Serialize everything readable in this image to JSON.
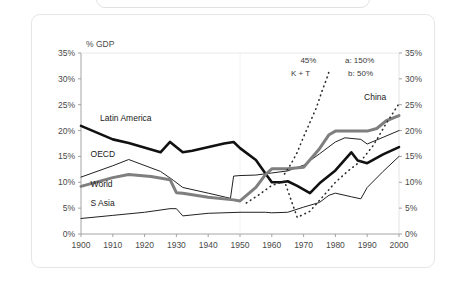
{
  "chart_data": {
    "type": "line",
    "title": "",
    "subtitle": "",
    "xlabel": "",
    "ylabel": "% GDP",
    "ylabel_right": "",
    "xlim": [
      1900,
      2000
    ],
    "ylim": [
      0,
      35
    ],
    "grid": false,
    "legend_position": "inline-labels",
    "x_ticks": [
      "1900",
      "1910",
      "1920",
      "1930",
      "1940",
      "1950",
      "1960",
      "1970",
      "1980",
      "1990",
      "2000"
    ],
    "y_ticks_left": [
      "0%",
      "5%",
      "10%",
      "15%",
      "20%",
      "25%",
      "30%",
      "35%"
    ],
    "y_ticks_right": [
      "0%",
      "5%",
      "10%",
      "15%",
      "20%",
      "25%",
      "30%",
      "35%"
    ],
    "series": [
      {
        "name": "Latin America",
        "style": "thick-black",
        "color": "#111111",
        "width": 2.6,
        "dashed": false,
        "x": [
          1900,
          1910,
          1915,
          1925,
          1928,
          1932,
          1935,
          1945,
          1948,
          1950,
          1955,
          1958,
          1960,
          1963,
          1965,
          1968,
          1972,
          1975,
          1980,
          1985,
          1987,
          1990,
          1995,
          2000
        ],
        "y": [
          20.9,
          18.3,
          17.6,
          15.8,
          17.8,
          15.8,
          16.1,
          17.5,
          17.8,
          16.6,
          14.3,
          11.7,
          10.0,
          10.0,
          10.2,
          9.3,
          7.9,
          9.8,
          12.3,
          15.8,
          14.2,
          13.7,
          15.4,
          16.8
        ]
      },
      {
        "name": "OECD",
        "style": "thin-black",
        "color": "#222222",
        "width": 1.0,
        "dashed": false,
        "x": [
          1900,
          1910,
          1915,
          1925,
          1929,
          1932,
          1940,
          1947,
          1948,
          1950,
          1955,
          1960,
          1965,
          1970,
          1975,
          1980,
          1983,
          1988,
          1990,
          1995,
          2000
        ],
        "y": [
          11.0,
          13.2,
          14.4,
          12.1,
          10.4,
          9.0,
          7.9,
          6.9,
          11.2,
          11.3,
          11.4,
          11.8,
          12.2,
          13.3,
          15.5,
          17.8,
          18.6,
          18.3,
          17.4,
          18.7,
          20.0
        ]
      },
      {
        "name": "World",
        "style": "thick-gray",
        "color": "#7f7f7f",
        "width": 3.0,
        "dashed": false,
        "x": [
          1900,
          1910,
          1915,
          1922,
          1928,
          1930,
          1932,
          1940,
          1948,
          1950,
          1955,
          1958,
          1960,
          1965,
          1970,
          1975,
          1978,
          1980,
          1985,
          1990,
          1993,
          1996,
          2000
        ],
        "y": [
          9.2,
          10.9,
          11.5,
          11.1,
          10.5,
          8.0,
          7.9,
          7.1,
          6.6,
          6.4,
          9.0,
          11.5,
          12.6,
          12.6,
          12.9,
          16.5,
          19.2,
          19.9,
          19.9,
          19.9,
          20.4,
          21.9,
          22.9
        ]
      },
      {
        "name": "S Asia",
        "style": "thin-black-lower",
        "color": "#222222",
        "width": 1.0,
        "dashed": false,
        "x": [
          1900,
          1910,
          1920,
          1928,
          1930,
          1932,
          1940,
          1950,
          1958,
          1960,
          1965,
          1970,
          1975,
          1978,
          1980,
          1985,
          1988,
          1990,
          1995,
          2000
        ],
        "y": [
          3.0,
          3.6,
          4.2,
          4.9,
          4.9,
          3.5,
          4.0,
          4.2,
          4.2,
          4.1,
          4.2,
          5.2,
          6.1,
          7.5,
          7.9,
          7.2,
          6.8,
          9.0,
          12.1,
          15.0
        ]
      },
      {
        "name": "K + T",
        "style": "dotted",
        "color": "#2b2b2b",
        "width": 1.6,
        "dashed": true,
        "x": [
          1964,
          1966,
          1968,
          1970,
          1972,
          1974,
          1975,
          1976,
          1977,
          1978
        ],
        "y": [
          11.6,
          13.5,
          15.8,
          18.8,
          21.6,
          24.4,
          26.2,
          28.0,
          29.6,
          31.4
        ]
      },
      {
        "name": "China",
        "style": "dotted",
        "color": "#2b2b2b",
        "width": 1.6,
        "dashed": true,
        "x": [
          1952,
          1956,
          1960,
          1964,
          1968,
          1972,
          1976,
          1980,
          1984,
          1988,
          1992,
          1996,
          2000
        ],
        "y": [
          6.0,
          7.6,
          9.4,
          10.2,
          3.2,
          4.4,
          7.2,
          10.0,
          12.2,
          14.1,
          17.2,
          21.4,
          25.2
        ]
      }
    ],
    "series_labels": [
      {
        "text": "Latin America",
        "x": 1906,
        "y": 21.8
      },
      {
        "text": "OECD",
        "x": 1903,
        "y": 14.9
      },
      {
        "text": "World",
        "x": 1903,
        "y": 9.1
      },
      {
        "text": "S Asia",
        "x": 1903,
        "y": 5.4
      },
      {
        "text": "China",
        "x": 1989,
        "y": 26.0
      }
    ],
    "annotations": [
      {
        "text": "45%",
        "x": 1969,
        "y": 33.1
      },
      {
        "text": "K + T",
        "x": 1966,
        "y": 30.6
      },
      {
        "text": "a: 150%",
        "x": 1983,
        "y": 33.1
      },
      {
        "text": "b: 50%",
        "x": 1984,
        "y": 30.6
      }
    ],
    "colors": {
      "thick_black": "#111111",
      "thin_black": "#222222",
      "thick_gray": "#7f7f7f",
      "dotted": "#2b2b2b",
      "axis": "#9a9a9a",
      "text": "#4a4a4a",
      "card_border": "#e6e6e6",
      "background": "#ffffff"
    }
  },
  "axis": {
    "y_title": "% GDP"
  }
}
